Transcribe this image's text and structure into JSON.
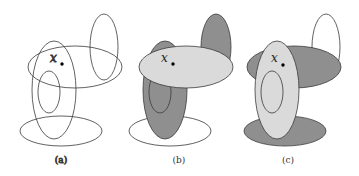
{
  "figure": {
    "point_label": "x",
    "colors": {
      "stroke": "#3a3a3a",
      "dark_fill": "#8f8f8f",
      "light_fill": "#dadada",
      "background": "#ffffff"
    },
    "panels": [
      {
        "caption": "(a)",
        "description": "Five unshaded ellipses with point x"
      },
      {
        "caption": "(b)",
        "description": "Horizontal ellipse light, vertical ellipse and top-right ellipse dark"
      },
      {
        "caption": "(c)",
        "description": "Vertical ellipse light, horizontal and bottom ellipses dark"
      }
    ]
  }
}
